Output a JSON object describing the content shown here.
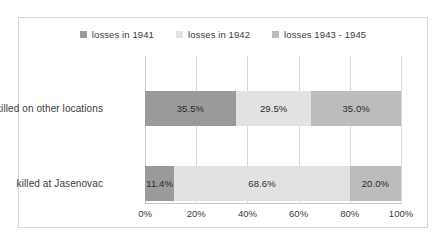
{
  "chart_data": {
    "type": "bar",
    "orientation": "horizontal",
    "stacked": true,
    "normalized": true,
    "title": "",
    "xlabel": "",
    "ylabel": "",
    "categories": [
      "killed on other locations",
      "killed at Jasenovac"
    ],
    "series": [
      {
        "name": "losses in 1941",
        "color": "#9a9a9a",
        "values": [
          35.5,
          11.4
        ],
        "labels": [
          "35.5%",
          "11.4%"
        ]
      },
      {
        "name": "losses in 1942",
        "color": "#e2e2e2",
        "values": [
          29.5,
          68.6
        ],
        "labels": [
          "29.5%",
          "68.6%"
        ]
      },
      {
        "name": "losses 1943 - 1945",
        "color": "#bcbcbc",
        "values": [
          35.0,
          20.0
        ],
        "labels": [
          "35.0%",
          "20.0%"
        ]
      }
    ],
    "xlim": [
      0,
      100
    ],
    "xticks": [
      0,
      20,
      40,
      60,
      80,
      100
    ],
    "xtick_labels": [
      "0%",
      "20%",
      "40%",
      "60%",
      "80%",
      "100%"
    ],
    "grid": true,
    "grid_axis": "x",
    "legend_position": "top"
  },
  "legend": {
    "items": [
      {
        "label": "losses in 1941",
        "color": "#9a9a9a"
      },
      {
        "label": "losses in 1942",
        "color": "#e2e2e2"
      },
      {
        "label": "losses 1943 - 1945",
        "color": "#bcbcbc"
      }
    ]
  },
  "axis": {
    "ticks": [
      {
        "label": "0%",
        "pos": 0
      },
      {
        "label": "20%",
        "pos": 20
      },
      {
        "label": "40%",
        "pos": 40
      },
      {
        "label": "60%",
        "pos": 60
      },
      {
        "label": "80%",
        "pos": 80
      },
      {
        "label": "100%",
        "pos": 100
      }
    ]
  },
  "colors": {
    "border": "#d7d7d7",
    "gridline": "#d9d9d9",
    "axis": "#c9c9c9",
    "text": "#3a3a3a",
    "label_text": "#2b2b2b",
    "background": "#ffffff"
  }
}
